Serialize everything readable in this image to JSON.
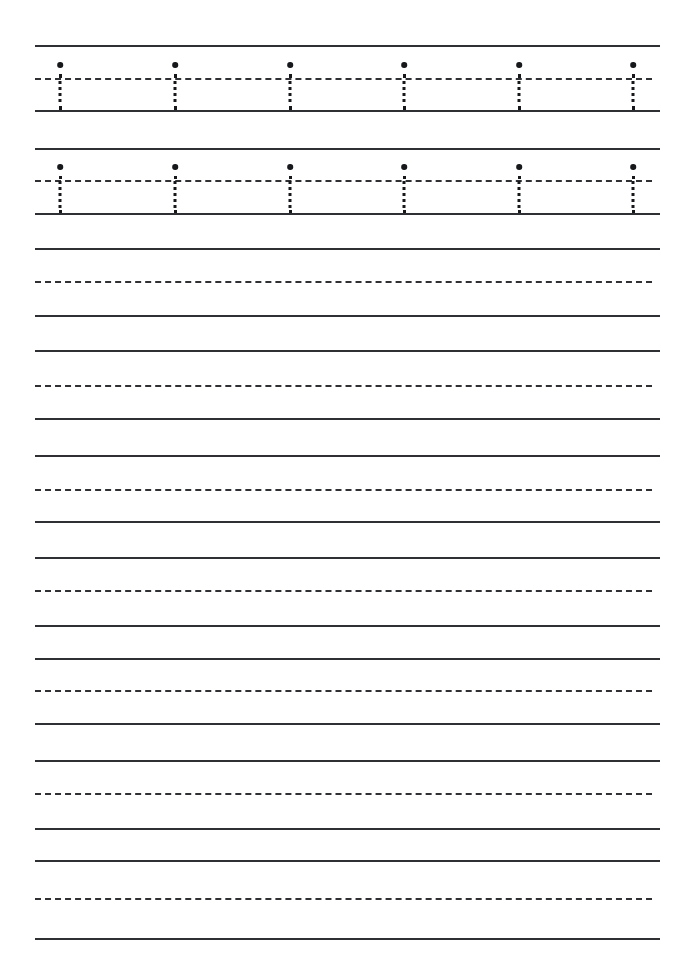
{
  "page": {
    "width": 695,
    "height": 974,
    "background_color": "#ffffff",
    "line_color": "#2f3034",
    "letter_color": "#17181b"
  },
  "geometry": {
    "line_left": 35,
    "line_right": 660,
    "line_width": 625,
    "solid_thickness": 2.6,
    "dashed_thickness": 2.2,
    "dash_length": 8,
    "dash_gap": 6
  },
  "letter_rows": [
    {
      "name": "trace-row-1",
      "top_line_y": 45,
      "mid_line_y": 78,
      "base_line_y": 110,
      "letter": "i",
      "letter_count": 6,
      "letter_x_positions": [
        60,
        175,
        290,
        404,
        519,
        633
      ]
    },
    {
      "name": "trace-row-2",
      "top_line_y": 148,
      "mid_line_y": 180,
      "base_line_y": 213,
      "letter": "i",
      "letter_count": 6,
      "letter_x_positions": [
        60,
        175,
        290,
        404,
        519,
        633
      ]
    }
  ],
  "blank_rows": [
    {
      "name": "practice-row-1",
      "top_line_y": 248,
      "mid_line_y": 281,
      "base_line_y": 315
    },
    {
      "name": "practice-row-2",
      "top_line_y": 350,
      "mid_line_y": 385,
      "base_line_y": 418
    },
    {
      "name": "practice-row-3",
      "top_line_y": 455,
      "mid_line_y": 489,
      "base_line_y": 521
    },
    {
      "name": "practice-row-4",
      "top_line_y": 557,
      "mid_line_y": 590,
      "base_line_y": 625
    },
    {
      "name": "practice-row-5",
      "top_line_y": 658,
      "mid_line_y": 690,
      "base_line_y": 723
    },
    {
      "name": "practice-row-6",
      "top_line_y": 760,
      "mid_line_y": 793,
      "base_line_y": 828
    },
    {
      "name": "practice-row-7",
      "top_line_y": 860,
      "mid_line_y": 898,
      "base_line_y": 938
    }
  ]
}
